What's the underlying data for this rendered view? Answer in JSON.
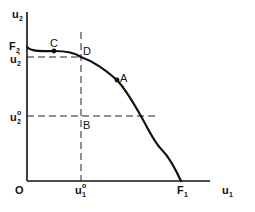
{
  "figure": {
    "type": "utility-possibility-frontier",
    "axes": {
      "x_label": "u",
      "x_label_sub": "1",
      "y_label": "u",
      "y_label_sub": "2",
      "origin_label": "O"
    },
    "intercepts": {
      "x": {
        "label": "F",
        "sub": "1"
      },
      "y": {
        "label": "F",
        "sub": "2"
      }
    },
    "reference_levels": {
      "u1_0": {
        "label": "u",
        "sub": "1",
        "sup": "o"
      },
      "u2_0": {
        "label": "u",
        "sub": "2",
        "sup": "o"
      },
      "u2_prime": {
        "label": "u",
        "sub": "2",
        "sup": "'"
      }
    },
    "points": [
      {
        "name": "C",
        "label": "C",
        "on_curve": true
      },
      {
        "name": "D",
        "label": "D",
        "on_curve": true
      },
      {
        "name": "A",
        "label": "A",
        "on_curve": true
      },
      {
        "name": "B",
        "label": "B",
        "on_curve": false
      }
    ]
  }
}
